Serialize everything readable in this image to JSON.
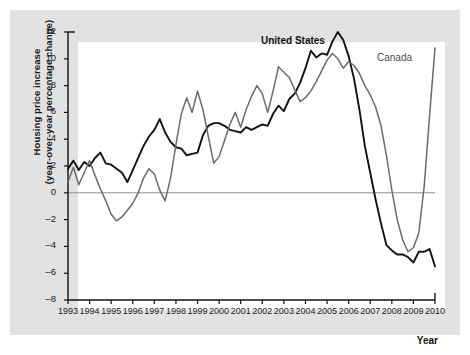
{
  "chart_data": {
    "type": "line",
    "title": "",
    "xlabel": "Year",
    "ylabel": "Housing price increase (year-over-year percentage change)",
    "ylabel_line1": "Housing price increase",
    "ylabel_line2": "(year-over-year percentage change)",
    "xlim": [
      1993,
      2010
    ],
    "ylim": [
      -8,
      12
    ],
    "yticks": [
      12,
      10,
      8,
      6,
      4,
      2,
      0,
      -2,
      -4,
      -6,
      -8
    ],
    "ytick_labels": [
      "12",
      "10",
      "8",
      "6",
      "4",
      "2",
      "0",
      "-2",
      "-4",
      "-6",
      "-8"
    ],
    "xticks": [
      1993,
      1994,
      1995,
      1996,
      1997,
      1998,
      1999,
      2000,
      2001,
      2002,
      2003,
      2004,
      2005,
      2006,
      2007,
      2008,
      2009,
      2010
    ],
    "xtick_labels": [
      "1993",
      "1994",
      "1995",
      "1996",
      "1997",
      "1998",
      "1999",
      "2000",
      "2001",
      "2002",
      "2003",
      "2004",
      "2005",
      "2006",
      "2007",
      "2008",
      "2009",
      "2010"
    ],
    "grid": false,
    "zero_line": true,
    "legend_position": "inline-annotations",
    "series": [
      {
        "name": "United States",
        "color": "#111111",
        "label_x": 2003.3,
        "label_y": 12.6,
        "x": [
          1993.0,
          1993.25,
          1993.5,
          1993.75,
          1994.0,
          1994.25,
          1994.5,
          1994.75,
          1995.0,
          1995.25,
          1995.5,
          1995.75,
          1996.0,
          1996.25,
          1996.5,
          1996.75,
          1997.0,
          1997.25,
          1997.5,
          1997.75,
          1998.0,
          1998.25,
          1998.5,
          1998.75,
          1999.0,
          1999.25,
          1999.5,
          1999.75,
          2000.0,
          2000.25,
          2000.5,
          2000.75,
          2001.0,
          2001.25,
          2001.5,
          2001.75,
          2002.0,
          2002.25,
          2002.5,
          2002.75,
          2003.0,
          2003.25,
          2003.5,
          2003.75,
          2004.0,
          2004.25,
          2004.5,
          2004.75,
          2005.0,
          2005.25,
          2005.5,
          2005.75,
          2006.0,
          2006.25,
          2006.5,
          2006.75,
          2007.0,
          2007.25,
          2007.5,
          2007.75,
          2008.0,
          2008.25,
          2008.5,
          2008.75,
          2009.0,
          2009.25,
          2009.5,
          2009.75,
          2010.0
        ],
        "y": [
          1.8,
          2.4,
          1.7,
          2.3,
          2.0,
          2.6,
          3.0,
          2.2,
          2.1,
          1.8,
          1.5,
          0.8,
          1.7,
          2.6,
          3.5,
          4.2,
          4.7,
          5.5,
          4.5,
          3.8,
          3.4,
          3.3,
          2.8,
          2.9,
          3.0,
          4.3,
          5.0,
          5.2,
          5.2,
          5.0,
          4.7,
          4.6,
          4.5,
          4.9,
          4.7,
          4.9,
          5.1,
          5.0,
          5.9,
          6.5,
          6.1,
          7.0,
          7.4,
          8.2,
          9.3,
          10.6,
          10.1,
          10.4,
          10.3,
          11.3,
          12.0,
          11.4,
          10.2,
          8.5,
          6.2,
          3.5,
          1.5,
          -0.5,
          -2.3,
          -3.9,
          -4.3,
          -4.6,
          -4.6,
          -4.8,
          -5.2,
          -4.4,
          -4.4,
          -4.2,
          -5.5
        ]
      },
      {
        "name": "Canada",
        "color": "#6b6b6b",
        "label_x": 2008.6,
        "label_y": 11.4,
        "x": [
          1993.0,
          1993.25,
          1993.5,
          1993.75,
          1994.0,
          1994.25,
          1994.5,
          1994.75,
          1995.0,
          1995.25,
          1995.5,
          1995.75,
          1996.0,
          1996.25,
          1996.5,
          1996.75,
          1997.0,
          1997.25,
          1997.5,
          1997.75,
          1998.0,
          1998.25,
          1998.5,
          1998.75,
          1999.0,
          1999.25,
          1999.5,
          1999.75,
          2000.0,
          2000.25,
          2000.5,
          2000.75,
          2001.0,
          2001.25,
          2001.5,
          2001.75,
          2002.0,
          2002.25,
          2002.5,
          2002.75,
          2003.0,
          2003.25,
          2003.5,
          2003.75,
          2004.0,
          2004.25,
          2004.5,
          2004.75,
          2005.0,
          2005.25,
          2005.5,
          2005.75,
          2006.0,
          2006.25,
          2006.5,
          2006.75,
          2007.0,
          2007.25,
          2007.5,
          2007.75,
          2008.0,
          2008.25,
          2008.5,
          2008.75,
          2009.0,
          2009.25,
          2009.5,
          2009.75,
          2010.0
        ],
        "y": [
          0.8,
          1.9,
          0.6,
          1.5,
          2.4,
          1.3,
          0.3,
          -0.6,
          -1.6,
          -2.1,
          -1.8,
          -1.3,
          -0.8,
          0.0,
          1.1,
          1.8,
          1.4,
          0.2,
          -0.6,
          1.1,
          3.6,
          5.9,
          7.1,
          6.0,
          7.6,
          6.2,
          4.2,
          2.2,
          2.7,
          3.9,
          5.1,
          6.0,
          4.9,
          6.2,
          7.2,
          8.0,
          7.4,
          6.0,
          7.6,
          9.4,
          9.0,
          8.6,
          7.7,
          6.8,
          7.1,
          7.6,
          8.3,
          9.1,
          9.9,
          10.4,
          10.0,
          9.3,
          9.8,
          9.5,
          8.9,
          8.0,
          7.3,
          6.4,
          5.0,
          2.8,
          0.2,
          -2.0,
          -3.5,
          -4.4,
          -4.1,
          -3.0,
          0.5,
          5.8,
          10.8
        ]
      }
    ]
  }
}
